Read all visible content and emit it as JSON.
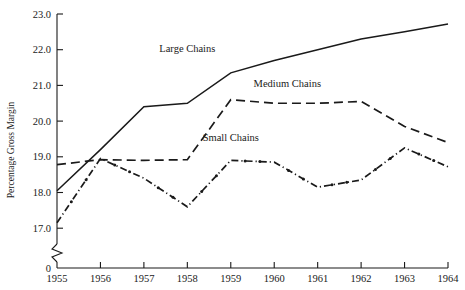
{
  "chart_data": {
    "type": "line",
    "title": "",
    "xlabel": "",
    "ylabel": "Percentage Gross Margin",
    "x": [
      1955,
      1956,
      1957,
      1958,
      1959,
      1960,
      1961,
      1962,
      1963,
      1964
    ],
    "xticklabels": [
      "1955",
      "1956",
      "1957",
      "1958",
      "1959",
      "1960",
      "1961",
      "1962",
      "1963",
      "1964"
    ],
    "yticklabels": [
      "0",
      "17.0",
      "18.0",
      "19.0",
      "20.0",
      "21.0",
      "22.0",
      "23.0"
    ],
    "ytickvalues": [
      17.0,
      18.0,
      19.0,
      20.0,
      21.0,
      22.0,
      23.0
    ],
    "ylim": [
      17.0,
      23.0
    ],
    "xlim": [
      1955,
      1964
    ],
    "axis_break": true,
    "zero_tick_label": "0",
    "grid": false,
    "legend_position": "inline-annotations",
    "series": [
      {
        "name": "Large Chains",
        "style": "solid",
        "markers": false,
        "label_x": 1958.0,
        "label_y": 21.95,
        "values": [
          18.05,
          19.2,
          20.4,
          20.5,
          21.35,
          21.7,
          22.0,
          22.3,
          22.5,
          22.72
        ]
      },
      {
        "name": "Medium Chains",
        "style": "dashed",
        "markers": false,
        "label_x": 1960.3,
        "label_y": 20.95,
        "values": [
          18.78,
          18.92,
          18.9,
          18.92,
          20.6,
          20.5,
          20.5,
          20.55,
          19.85,
          19.4
        ]
      },
      {
        "name": "Small Chains",
        "style": "dash-dot",
        "markers": true,
        "label_x": 1959.0,
        "label_y": 19.45,
        "values": [
          17.15,
          18.95,
          18.4,
          17.6,
          18.9,
          18.85,
          18.15,
          18.35,
          19.25,
          18.72
        ]
      }
    ]
  },
  "geometry": {
    "plot_left": 57,
    "plot_right": 448,
    "y_top_px": 14,
    "y_bottom_px": 228,
    "px_per_unit": 35.7,
    "axis_bottom_px": 268,
    "break_top_px": 244,
    "break_bottom_px": 262
  },
  "colors": {
    "ink": "#1a1a1a",
    "background": "#ffffff"
  }
}
